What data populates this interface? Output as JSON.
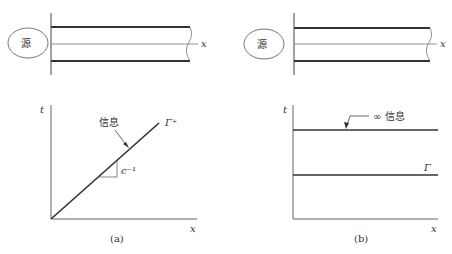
{
  "panel_a": {
    "source_label": "源",
    "x_axis_label_top": "x",
    "t_axis_label": "t",
    "x_axis_label_bottom": "x",
    "info_label": "信息",
    "slope_label": "c⁻¹",
    "characteristic_label": "Γ⁺",
    "caption": "(a)"
  },
  "panel_b": {
    "source_label": "源",
    "x_axis_label_top": "x",
    "t_axis_label": "t",
    "x_axis_label_bottom": "x",
    "info_label": "∞ 信息",
    "characteristic_label": "Γ",
    "caption": "(b)"
  },
  "colors": {
    "line": "#333333",
    "thin": "#666666"
  }
}
